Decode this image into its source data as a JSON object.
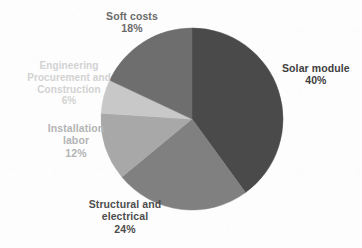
{
  "chart_data": {
    "type": "pie",
    "title": "",
    "subtitle": "",
    "xlabel": "",
    "ylabel": "",
    "legend_position": "none",
    "grid": false,
    "units": "percent",
    "total": 100,
    "start_angle_deg": 0,
    "direction": "clockwise",
    "categories": [
      "Solar module",
      "Structural and electrical",
      "Installation labor",
      "Engineering Procurement and Construction",
      "Soft costs"
    ],
    "values": [
      40,
      24,
      12,
      6,
      18
    ],
    "value_labels": [
      "40%",
      "24%",
      "12%",
      "6%",
      "18%"
    ],
    "colors": [
      "#4a4a4a",
      "#808080",
      "#a8a8a8",
      "#c8c8c8",
      "#6e6e6e"
    ],
    "slices": [
      {
        "name": "Solar module",
        "value": 40,
        "value_label": "40%",
        "color": "#4a4a4a",
        "start_deg": 0,
        "end_deg": 144,
        "label_lines": [
          "Solar module"
        ],
        "label_color": "#3d3d3d"
      },
      {
        "name": "Structural and electrical",
        "value": 24,
        "value_label": "24%",
        "color": "#808080",
        "start_deg": 144,
        "end_deg": 230.4,
        "label_lines": [
          "Structural and",
          "electrical"
        ],
        "label_color": "#4d4d4d"
      },
      {
        "name": "Installation labor",
        "value": 12,
        "value_label": "12%",
        "color": "#a8a8a8",
        "start_deg": 230.4,
        "end_deg": 273.6,
        "label_lines": [
          "Installation",
          "labor"
        ],
        "label_color": "#b4b4b4"
      },
      {
        "name": "Engineering Procurement and Construction",
        "value": 6,
        "value_label": "6%",
        "color": "#c8c8c8",
        "start_deg": 273.6,
        "end_deg": 295.2,
        "label_lines": [
          "Engineering",
          "Procurement and",
          "Construction"
        ],
        "label_color": "#d2d2d2"
      },
      {
        "name": "Soft costs",
        "value": 18,
        "value_label": "18%",
        "color": "#6e6e6e",
        "start_deg": 295.2,
        "end_deg": 360,
        "label_lines": [
          "Soft costs"
        ],
        "label_color": "#6a6a6a"
      }
    ]
  },
  "labels": {
    "solar_module": {
      "name": "Solar module",
      "value": "40%"
    },
    "structural_electrical": {
      "line1": "Structural and",
      "line2": "electrical",
      "value": "24%"
    },
    "installation_labor": {
      "line1": "Installation",
      "line2": "labor",
      "value": "12%"
    },
    "epc": {
      "line1": "Engineering",
      "line2": "Procurement and",
      "line3": "Construction",
      "value": "6%"
    },
    "soft_costs": {
      "name": "Soft costs",
      "value": "18%"
    }
  },
  "geometry": {
    "center_x": 192,
    "center_y": 119,
    "radius": 91
  },
  "background_color": "#fdfdfd"
}
